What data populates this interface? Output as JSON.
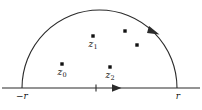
{
  "figure": {
    "stroke_color": "#2b2b2b",
    "dot_color": "#111111",
    "background": "#ffffff",
    "width": 202,
    "height": 110
  },
  "axis": {
    "baseline_y": 88,
    "left_end_x": 2,
    "right_end_x": 200,
    "origin_tick_x": 96,
    "labels": [
      {
        "name": "left-radius-label",
        "text": "−r",
        "x": 22,
        "y": 92
      },
      {
        "name": "right-radius-label",
        "text": "r",
        "x": 177,
        "y": 92
      }
    ],
    "direction_arrow": {
      "name": "baseline-direction-arrow",
      "x": 118,
      "y": 88,
      "points": "right"
    }
  },
  "arc": {
    "name": "upper-semicircle-arc",
    "center_x": 99.5,
    "center_y": 88,
    "radius_x": 77.5,
    "radius_y": 78,
    "left_x": 22,
    "right_x": 177,
    "apex_y": 10,
    "direction_arrow": {
      "name": "arc-direction-arrow",
      "x": 155,
      "y": 32,
      "points": "counterclockwise-descending-right"
    }
  },
  "poles": [
    {
      "name": "pole-z0",
      "label": "z",
      "subscript": "0",
      "dot_x": 62,
      "dot_y": 64,
      "label_x": 62,
      "label_y": 70,
      "labeled": true
    },
    {
      "name": "pole-z1",
      "label": "z",
      "subscript": "1",
      "dot_x": 93,
      "dot_y": 36,
      "label_x": 93,
      "label_y": 42,
      "labeled": true
    },
    {
      "name": "pole-z2",
      "label": "z",
      "subscript": "2",
      "dot_x": 110,
      "dot_y": 67,
      "label_x": 110,
      "label_y": 73,
      "labeled": true
    },
    {
      "name": "pole-unlabeled-upper",
      "label": "",
      "subscript": "",
      "dot_x": 125,
      "dot_y": 31,
      "label_x": 0,
      "label_y": 0,
      "labeled": false
    },
    {
      "name": "pole-unlabeled-lower",
      "label": "",
      "subscript": "",
      "dot_x": 137,
      "dot_y": 45,
      "label_x": 0,
      "label_y": 0,
      "labeled": false
    }
  ]
}
